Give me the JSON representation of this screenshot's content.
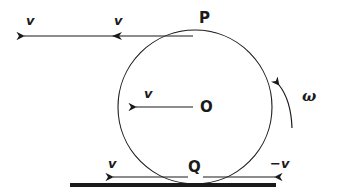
{
  "diagram": {
    "colors": {
      "line": "#1a1a1a",
      "background": "#ffffff"
    },
    "points": {
      "top": {
        "label": "P"
      },
      "center": {
        "label": "O"
      },
      "bottom": {
        "label": "Q"
      }
    },
    "vectors": {
      "top_long": {
        "label": "v"
      },
      "top_short": {
        "label": "v"
      },
      "center": {
        "label": "v"
      },
      "bottom_left": {
        "label": "v"
      },
      "bottom_right": {
        "label": "−v"
      }
    },
    "rotation": {
      "label": "ω",
      "direction": "counterclockwise"
    }
  }
}
